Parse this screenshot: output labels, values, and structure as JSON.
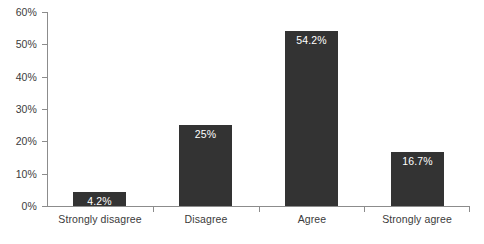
{
  "chart_data": {
    "type": "bar",
    "title": "",
    "subtitle": "",
    "xlabel": "",
    "ylabel": "",
    "categories": [
      "Strongly disagree",
      "Disagree",
      "Agree",
      "Strongly agree"
    ],
    "values": [
      4.2,
      25,
      54.2,
      16.7
    ],
    "value_labels": [
      "4.2%",
      "25%",
      "54.2%",
      "16.7%"
    ],
    "ylim": [
      0,
      60
    ],
    "ytick_values": [
      0,
      10,
      20,
      30,
      40,
      50,
      60
    ],
    "ytick_labels": [
      "0%",
      "10%",
      "20%",
      "30%",
      "40%",
      "50%",
      "60%"
    ],
    "grid": false,
    "legend": null,
    "legend_position": "none",
    "bar_color": "#333333",
    "value_label_color": "#ffffff",
    "axis_color": "#8c8c8c",
    "tick_label_color": "#3b3b3b",
    "background_color": "#ffffff"
  }
}
